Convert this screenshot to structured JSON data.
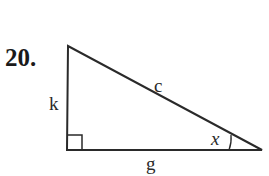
{
  "problem": {
    "number": "20."
  },
  "triangle": {
    "type": "right triangle",
    "labels": {
      "hypotenuse": "c",
      "vertical_leg": "k",
      "horizontal_leg": "g",
      "angle": "x"
    },
    "right_angle_marker": "bottom-left",
    "angle_marker": "right vertex",
    "stroke_color": "#2a2a2a"
  }
}
